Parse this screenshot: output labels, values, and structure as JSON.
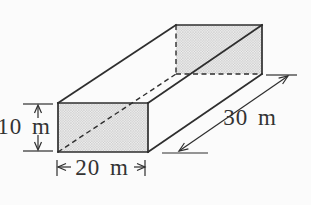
{
  "figure": {
    "type": "geometry-diagram",
    "labels": {
      "height": "10 m",
      "width": "20 m",
      "depth": "30 m"
    }
  },
  "colors": {
    "line": "#2e2e2e",
    "text": "#333333",
    "face_fill": "#f0f0f0",
    "stipple_dot": "#b2b2b2",
    "background": "#fbfbfb"
  }
}
